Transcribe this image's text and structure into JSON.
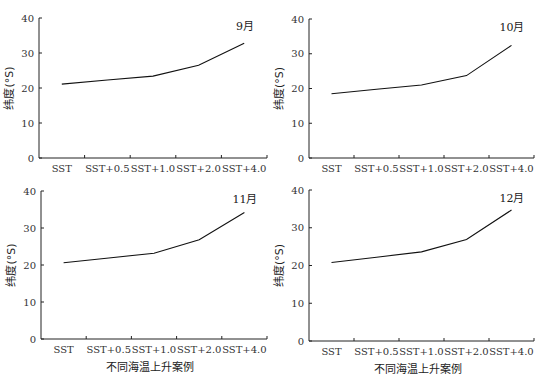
{
  "figure": {
    "ylabel": "纬度(°S)",
    "xlabel": "不同海温上升案例"
  },
  "chart_data": [
    {
      "type": "line",
      "title": "9月",
      "categories": [
        "SST",
        "SST+0.5",
        "SST+1.0",
        "SST+2.0",
        "SST+4.0"
      ],
      "series": [
        {
          "name": "纬度",
          "values": [
            21.1,
            22.3,
            23.4,
            26.5,
            32.8
          ]
        }
      ],
      "xlabel": "",
      "ylabel": "纬度(°S)",
      "ylim": [
        0,
        40
      ],
      "yticks": [
        0,
        10,
        20,
        30,
        40
      ],
      "grid": false,
      "panel": {
        "x0": 39,
        "y0": 158,
        "x1": 267,
        "ytop": 18
      }
    },
    {
      "type": "line",
      "title": "10月",
      "categories": [
        "SST",
        "SST+0.5",
        "SST+1.0",
        "SST+2.0",
        "SST+4.0"
      ],
      "series": [
        {
          "name": "纬度",
          "values": [
            18.5,
            19.8,
            21.0,
            23.7,
            32.4
          ]
        }
      ],
      "xlabel": "",
      "ylabel": "纬度(°S)",
      "ylim": [
        0,
        40
      ],
      "yticks": [
        0,
        10,
        20,
        30,
        40
      ],
      "grid": false,
      "panel": {
        "x0": 309,
        "y0": 158,
        "x1": 534,
        "ytop": 19
      }
    },
    {
      "type": "line",
      "title": "11月",
      "categories": [
        "SST",
        "SST+0.5",
        "SST+1.0",
        "SST+2.0",
        "SST+4.0"
      ],
      "series": [
        {
          "name": "纬度",
          "values": [
            20.6,
            21.9,
            23.2,
            26.8,
            34.2
          ]
        }
      ],
      "xlabel": "不同海温上升案例",
      "ylabel": "纬度(°S)",
      "ylim": [
        0,
        40
      ],
      "yticks": [
        0,
        10,
        20,
        30,
        40
      ],
      "grid": false,
      "panel": {
        "x0": 41,
        "y0": 339,
        "x1": 267,
        "ytop": 191
      }
    },
    {
      "type": "line",
      "title": "12月",
      "categories": [
        "SST",
        "SST+0.5",
        "SST+1.0",
        "SST+2.0",
        "SST+4.0"
      ],
      "series": [
        {
          "name": "纬度",
          "values": [
            20.8,
            22.2,
            23.6,
            26.9,
            34.7
          ]
        }
      ],
      "xlabel": "不同海温上升案例",
      "ylabel": "纬度(°S)",
      "ylim": [
        0,
        40
      ],
      "yticks": [
        0,
        10,
        20,
        30,
        40
      ],
      "grid": false,
      "panel": {
        "x0": 309,
        "y0": 341,
        "x1": 534,
        "ytop": 190
      }
    }
  ]
}
